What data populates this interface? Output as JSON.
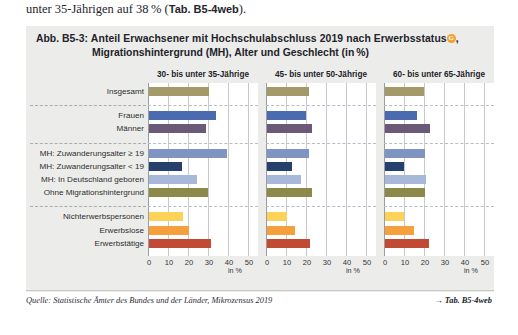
{
  "intro": {
    "text_before": "unter 35-Jährigen auf 38 % (",
    "ref_bold": "Tab. B5-4web",
    "text_after": ")."
  },
  "figure": {
    "number": "Abb. B5-3:",
    "title_line1": "Anteil Erwachsener mit Hochschulabschluss 2019 nach Erwerbsstatus",
    "glossary_marker": "G",
    "title_line1_tail": ",",
    "title_line2": "Migrationshintergrund (MH), Alter und Geschlecht (in %)",
    "source_label": "Quelle: Statistische Ämter des Bundes und der Länder, Mikrozensus 2019",
    "tab_reference": "→ Tab. B5-4web"
  },
  "chart_data": {
    "type": "bar",
    "orientation": "horizontal",
    "xlabel": "in %",
    "ylabel": "",
    "xlim": [
      0,
      50
    ],
    "xticks": [
      0,
      10,
      20,
      30,
      40,
      50
    ],
    "xticklabels": [
      "0",
      "10",
      "20",
      "30",
      "40",
      "50"
    ],
    "grid": true,
    "legend_position": "none",
    "axis_unit_label": "in %",
    "panels": [
      {
        "label": "30- bis unter 35-Jährige"
      },
      {
        "label": "45- bis unter 50-Jährige"
      },
      {
        "label": "60- bis unter 65-Jährige"
      }
    ],
    "categories": [
      "Insgesamt",
      "Frauen",
      "Männer",
      "MH: Zuwanderungsalter ≥ 19",
      "MH: Zuwanderungsalter < 19",
      "MH: In Deutschland geboren",
      "Ohne Migrationshintergrund",
      "Nichterwerbspersonen",
      "Erwerbslose",
      "Erwerbstätige"
    ],
    "category_groups": [
      {
        "name": "gesamt",
        "rows": [
          "Insgesamt"
        ]
      },
      {
        "name": "geschlecht",
        "rows": [
          "Frauen",
          "Männer"
        ]
      },
      {
        "name": "migration",
        "rows": [
          "MH: Zuwanderungsalter ≥ 19",
          "MH: Zuwanderungsalter < 19",
          "MH: In Deutschland geboren",
          "Ohne Migrationshintergrund"
        ]
      },
      {
        "name": "erwerbsstatus",
        "rows": [
          "Nichterwerbspersonen",
          "Erwerbslose",
          "Erwerbstätige"
        ]
      }
    ],
    "bar_colors": {
      "Insgesamt": "#a39a68",
      "Frauen": "#4a6bb0",
      "Männer": "#6a5a78",
      "MH: Zuwanderungsalter ≥ 19": "#7e95c4",
      "MH: Zuwanderungsalter < 19": "#26406e",
      "MH: In Deutschland geboren": "#a8b8d8",
      "Ohne Migrationshintergrund": "#8b8a4a",
      "Nichterwerbspersonen": "#fcd259",
      "Erwerbslose": "#f5a03c",
      "Erwerbstätige": "#c14a35"
    },
    "series": [
      {
        "name": "30- bis unter 35-Jährige",
        "values": [
          30.0,
          33.5,
          28.5,
          39.0,
          16.5,
          24.0,
          29.5,
          17.0,
          20.0,
          31.0
        ]
      },
      {
        "name": "45- bis unter 50-Jährige",
        "values": [
          21.0,
          19.5,
          22.5,
          21.0,
          12.5,
          17.0,
          22.5,
          10.0,
          14.0,
          21.5
        ]
      },
      {
        "name": "60- bis unter 65-Jährige",
        "values": [
          19.5,
          16.0,
          22.5,
          20.0,
          9.5,
          20.5,
          20.0,
          9.5,
          14.5,
          22.0
        ]
      }
    ]
  }
}
